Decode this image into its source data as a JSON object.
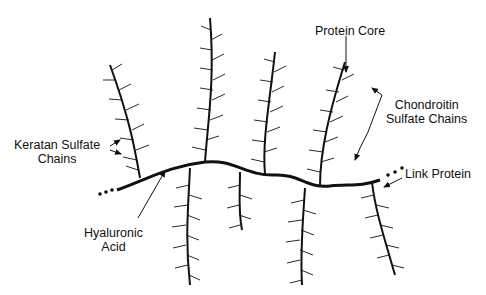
{
  "labels": {
    "protein_core": "Protein Core",
    "chondroitin_line1": "Chondroitin",
    "chondroitin_line2": "Sulfate Chains",
    "keratan_line1": "Keratan Sulfate",
    "keratan_line2": "Chains",
    "link_protein": "Link Protein",
    "hyaluronic_line1": "Hyaluronic",
    "hyaluronic_line2": "Acid"
  },
  "colors": {
    "ink": "#111111",
    "background": "#ffffff"
  }
}
